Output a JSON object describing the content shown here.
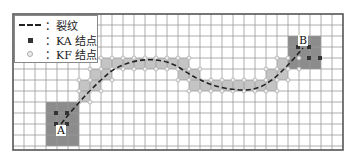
{
  "figure": {
    "frame": {
      "x": 13,
      "y": 14,
      "width": 330,
      "height": 136
    },
    "grid": {
      "cell": 11,
      "cols": 30,
      "rows": 12,
      "line_color": "#9a9a9a",
      "frame_color": "#555555"
    },
    "colors": {
      "tip_region": "#8c8c8c",
      "crack_band": "#c4c4c4",
      "crack_line": "#222222",
      "ka_node": "#333333",
      "kf_node": "#eeeeee"
    },
    "legend": {
      "items": [
        {
          "symbol": "dashed-line",
          "label": "：裂纹"
        },
        {
          "symbol": "filled-square",
          "label": "：K_A 结点",
          "display": "：KA 结点"
        },
        {
          "symbol": "hollow-circle",
          "label": "：K_F 结点",
          "display": "：KF 结点"
        }
      ]
    },
    "points": {
      "A": {
        "label": "A",
        "x": 61,
        "y": 130
      },
      "B": {
        "label": "B",
        "x": 303,
        "y": 43
      }
    },
    "tip_regions": [
      {
        "name": "tip-region-A",
        "x": 46,
        "y": 102,
        "w": 33,
        "h": 44
      },
      {
        "name": "tip-region-B",
        "x": 288,
        "y": 36,
        "w": 33,
        "h": 33
      }
    ],
    "band_cells": [
      [
        79,
        91
      ],
      [
        79,
        80
      ],
      [
        90,
        80
      ],
      [
        90,
        69
      ],
      [
        101,
        69
      ],
      [
        101,
        58
      ],
      [
        112,
        58
      ],
      [
        123,
        58
      ],
      [
        134,
        58
      ],
      [
        145,
        58
      ],
      [
        156,
        58
      ],
      [
        167,
        58
      ],
      [
        178,
        58
      ],
      [
        178,
        69
      ],
      [
        189,
        69
      ],
      [
        189,
        80
      ],
      [
        200,
        80
      ],
      [
        211,
        80
      ],
      [
        222,
        80
      ],
      [
        233,
        80
      ],
      [
        244,
        80
      ],
      [
        255,
        80
      ],
      [
        266,
        80
      ],
      [
        266,
        69
      ],
      [
        277,
        69
      ],
      [
        277,
        58
      ],
      [
        288,
        58
      ]
    ],
    "crack_path": "M61,124 C80,100 95,85 110,72 C130,58 160,55 180,68 C200,82 220,90 245,90 C265,90 280,75 303,48"
  }
}
